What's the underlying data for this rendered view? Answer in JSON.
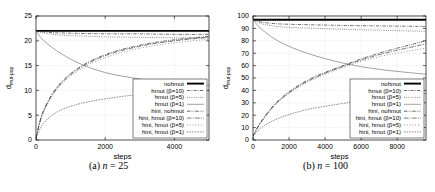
{
  "figure": {
    "panels": [
      {
        "id": "panel-a",
        "caption_prefix": "(a)",
        "caption_var": "n",
        "caption_eq": "=",
        "caption_value": "25"
      },
      {
        "id": "panel-b",
        "caption_prefix": "(b)",
        "caption_var": "n",
        "caption_eq": "=",
        "caption_value": "100"
      }
    ]
  },
  "legend": {
    "entries": [
      {
        "label": "nohmut",
        "style": "solid-thick"
      },
      {
        "label": "hmut (β=10)",
        "style": "dashdot"
      },
      {
        "label": "hmut (β=5)",
        "style": "dotted"
      },
      {
        "label": "hmut (β=1)",
        "style": "solid-thin"
      },
      {
        "label": "hini, nohmut",
        "style": "dashdotdot"
      },
      {
        "label": "hini, hmut (β=10)",
        "style": "dashdot-long"
      },
      {
        "label": "hini, hmut (β=5)",
        "style": "dotted-sparse"
      },
      {
        "label": "hini, hmut (β=1)",
        "style": "dotted-fine"
      }
    ]
  },
  "chart_data": [
    {
      "type": "line",
      "title": "",
      "xlabel": "steps",
      "ylabel": "d_mut-pop",
      "ylabel_main": "d",
      "ylabel_sub": "mut-pop",
      "xlim": [
        0,
        5000
      ],
      "ylim": [
        0,
        25
      ],
      "xticks": [
        0,
        2000,
        4000
      ],
      "yticks": [
        0,
        5,
        10,
        15,
        20,
        25
      ],
      "grid": true,
      "legend_position": "bottom-right",
      "series": [
        {
          "name": "nohmut",
          "style": "solid-thick",
          "x": [
            0,
            200,
            600,
            1200,
            2000,
            3000,
            4000,
            5000
          ],
          "y": [
            22.0,
            22.0,
            22.0,
            22.0,
            22.0,
            22.0,
            22.0,
            22.0
          ]
        },
        {
          "name": "hmut (β=10)",
          "style": "dashdot",
          "x": [
            0,
            200,
            600,
            1200,
            2000,
            3000,
            4000,
            5000
          ],
          "y": [
            22.0,
            21.8,
            21.6,
            21.5,
            21.4,
            21.4,
            21.3,
            21.3
          ]
        },
        {
          "name": "hmut (β=5)",
          "style": "dotted",
          "x": [
            0,
            200,
            600,
            1200,
            2000,
            3000,
            4000,
            5000
          ],
          "y": [
            22.0,
            21.6,
            21.2,
            21.0,
            20.8,
            20.7,
            20.6,
            20.6
          ]
        },
        {
          "name": "hmut (β=1)",
          "style": "solid-thin",
          "x": [
            0,
            200,
            600,
            1200,
            2000,
            3000,
            4000,
            5000
          ],
          "y": [
            22.0,
            20.2,
            18.0,
            15.6,
            13.6,
            12.3,
            11.5,
            11.0
          ]
        },
        {
          "name": "hini, nohmut",
          "style": "dashdotdot",
          "x": [
            0,
            200,
            600,
            1200,
            2000,
            3000,
            4000,
            5000
          ],
          "y": [
            0.4,
            5.6,
            10.6,
            14.4,
            17.2,
            19.1,
            20.2,
            20.9
          ]
        },
        {
          "name": "hini, hmut (β=10)",
          "style": "dashdot-long",
          "x": [
            0,
            200,
            600,
            1200,
            2000,
            3000,
            4000,
            5000
          ],
          "y": [
            0.4,
            5.5,
            10.4,
            14.2,
            17.0,
            18.9,
            20.0,
            20.7
          ]
        },
        {
          "name": "hini, hmut (β=5)",
          "style": "dotted-sparse",
          "x": [
            0,
            200,
            600,
            1200,
            2000,
            3000,
            4000,
            5000
          ],
          "y": [
            0.4,
            5.3,
            10.1,
            13.9,
            16.6,
            18.5,
            19.6,
            20.3
          ]
        },
        {
          "name": "hini, hmut (β=1)",
          "style": "dotted-fine",
          "x": [
            0,
            200,
            600,
            1200,
            2000,
            3000,
            4000,
            5000
          ],
          "y": [
            0.4,
            3.2,
            5.6,
            7.2,
            8.3,
            9.2,
            9.7,
            10.0
          ]
        }
      ]
    },
    {
      "type": "line",
      "title": "",
      "xlabel": "steps",
      "ylabel": "d_mut-pop",
      "ylabel_main": "d",
      "ylabel_sub": "mut-pop",
      "xlim": [
        0,
        9600
      ],
      "ylim": [
        0,
        100
      ],
      "xticks": [
        0,
        2000,
        4000,
        6000,
        8000
      ],
      "yticks": [
        0,
        10,
        20,
        30,
        40,
        50,
        60,
        70,
        80,
        90,
        100
      ],
      "grid": true,
      "legend_position": "bottom-right",
      "series": [
        {
          "name": "nohmut",
          "style": "solid-thick",
          "x": [
            0,
            500,
            1500,
            3000,
            5000,
            7000,
            9600
          ],
          "y": [
            97.0,
            97.0,
            97.0,
            97.0,
            97.0,
            97.0,
            97.0
          ]
        },
        {
          "name": "hmut (β=10)",
          "style": "dashdot",
          "x": [
            0,
            500,
            1500,
            3000,
            5000,
            7000,
            9600
          ],
          "y": [
            97.0,
            95.0,
            93.6,
            93.0,
            92.4,
            92.0,
            91.6
          ]
        },
        {
          "name": "hmut (β=5)",
          "style": "dotted",
          "x": [
            0,
            500,
            1500,
            3000,
            5000,
            7000,
            9600
          ],
          "y": [
            97.0,
            93.6,
            91.4,
            90.3,
            89.3,
            88.5,
            87.6
          ]
        },
        {
          "name": "hmut (β=1)",
          "style": "solid-thin",
          "x": [
            0,
            500,
            1500,
            3000,
            5000,
            7000,
            9600
          ],
          "y": [
            97.0,
            89.0,
            79.0,
            70.0,
            62.0,
            57.0,
            53.0
          ]
        },
        {
          "name": "hini, nohmut",
          "style": "dashdotdot",
          "x": [
            0,
            500,
            1500,
            3000,
            5000,
            7000,
            9600
          ],
          "y": [
            3.0,
            16.0,
            33.0,
            48.0,
            60.0,
            70.0,
            80.0
          ]
        },
        {
          "name": "hini, hmut (β=10)",
          "style": "dashdot-long",
          "x": [
            0,
            500,
            1500,
            3000,
            5000,
            7000,
            9600
          ],
          "y": [
            3.0,
            15.6,
            32.4,
            47.2,
            59.4,
            68.8,
            77.5
          ]
        },
        {
          "name": "hini, hmut (β=5)",
          "style": "dotted-sparse",
          "x": [
            0,
            500,
            1500,
            3000,
            5000,
            7000,
            9600
          ],
          "y": [
            3.0,
            15.2,
            31.8,
            46.4,
            58.4,
            67.2,
            74.0
          ]
        },
        {
          "name": "hini, hmut (β=1)",
          "style": "dotted-fine",
          "x": [
            0,
            500,
            1500,
            3000,
            5000,
            7000,
            9600
          ],
          "y": [
            3.0,
            10.5,
            18.0,
            24.5,
            29.5,
            33.5,
            37.5
          ]
        }
      ]
    }
  ]
}
